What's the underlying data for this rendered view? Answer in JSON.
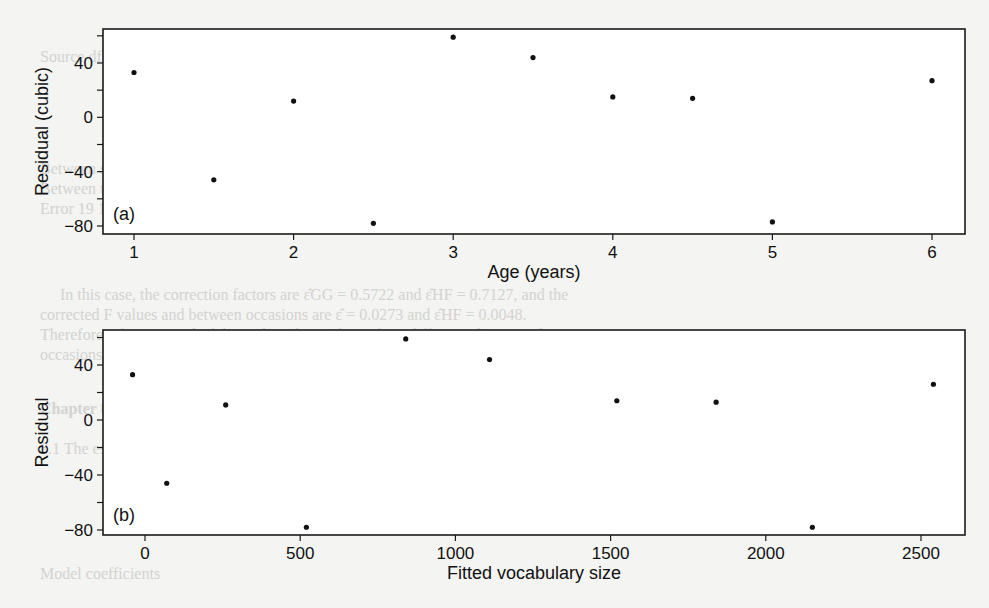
{
  "chart_data": [
    {
      "type": "scatter",
      "panel_label": "(a)",
      "title": "",
      "xlabel": "Age (years)",
      "ylabel": "Residual (cubic)",
      "xlim": [
        0.85,
        6.2
      ],
      "ylim": [
        -84,
        64
      ],
      "xticks": [
        1,
        2,
        3,
        4,
        5,
        6
      ],
      "yticks": [
        40,
        0,
        -40,
        -80
      ],
      "grid": false,
      "x": [
        1,
        1.5,
        2,
        2.5,
        3,
        3.5,
        4,
        4.5,
        5,
        6
      ],
      "y": [
        33,
        -46,
        12,
        -78,
        59,
        44,
        15,
        14,
        -77,
        27
      ]
    },
    {
      "type": "scatter",
      "panel_label": "(b)",
      "title": "",
      "xlabel": "Fitted vocabulary size",
      "ylabel": "Residual",
      "xlim": [
        -120,
        2640
      ],
      "ylim": [
        -84,
        64
      ],
      "xticks": [
        0,
        500,
        1000,
        1500,
        2000,
        2500
      ],
      "yticks": [
        40,
        0,
        -40,
        -80
      ],
      "grid": false,
      "x": [
        -40,
        70,
        260,
        520,
        840,
        1110,
        1520,
        1840,
        2150,
        2540
      ],
      "y": [
        33,
        -46,
        11,
        -78,
        59,
        44,
        14,
        13,
        -78,
        26
      ]
    }
  ],
  "bleed_through_text": [
    "Source              df        SS         MS",
    "Between subjects   13   2409.48    11    61.45   51",
    "Between treatments  13   2464     4   40,456.45   5.36   0.0000",
    "Error              19   1461.53  16    61.15",
    "In this case, the correction factors are ε̂GG = 0.5722 and ε̂HF = 0.7127, and the",
    "corrected F values and between occasions are ε̂ = 0.0273 and ε̂HF = 0.0048.",
    "Therefore, after removal of the outlier, the evidence for a difference between the",
    "occasions is not particularly convincing.",
    "Chapter 8",
    "8.1  The estimated coefficients for the quadratic and cubic models are as follows:",
    "Model     coefficients"
  ]
}
